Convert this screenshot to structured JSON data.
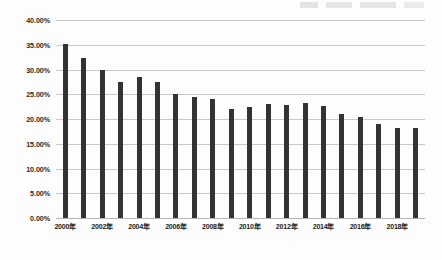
{
  "chart_data": {
    "type": "bar",
    "title": "",
    "subtitle": "",
    "xlabel": "",
    "ylabel": "",
    "ylim": [
      0,
      40
    ],
    "ytick_labels": [
      "40.00%",
      "35.00%",
      "30.00%",
      "25.00%",
      "20.00%",
      "15.00%",
      "10.00%",
      "5.00%",
      "0.00%"
    ],
    "ytick_values": [
      40,
      35,
      30,
      25,
      20,
      15,
      10,
      5,
      0
    ],
    "grid": true,
    "legend": null,
    "legend_position": "none",
    "bar_color": "#333333",
    "gridline_color": "#c9c9c9",
    "categories": [
      "2000年",
      "2001年",
      "2002年",
      "2003年",
      "2004年",
      "2005年",
      "2006年",
      "2007年",
      "2008年",
      "2009年",
      "2010年",
      "2011年",
      "2012年",
      "2013年",
      "2014年",
      "2015年",
      "2016年",
      "2017年",
      "2018年",
      "2019年"
    ],
    "visible_xtick_labels": [
      "2000年",
      "2002年",
      "2004年",
      "2006年",
      "2008年",
      "2010年",
      "2012年",
      "2014年",
      "2016年",
      "2018年"
    ],
    "values": [
      35.2,
      32.3,
      30.0,
      27.5,
      28.5,
      27.5,
      25.1,
      24.4,
      24.1,
      22.1,
      22.5,
      23.0,
      22.8,
      23.2,
      22.6,
      21.0,
      20.4,
      18.9,
      18.2,
      18.1
    ]
  }
}
